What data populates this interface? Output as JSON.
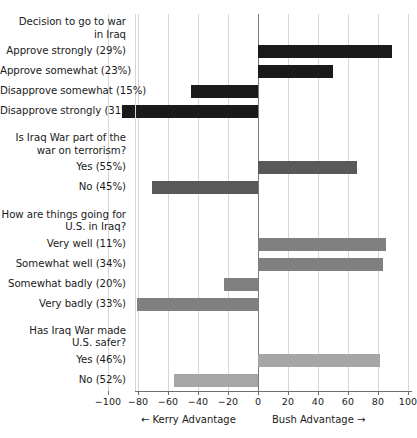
{
  "chart_data": {
    "type": "bar",
    "orientation": "horizontal",
    "title": "",
    "xlabel": "",
    "ylabel": "",
    "xlim": [
      -100,
      100
    ],
    "xticks": [
      -100,
      -80,
      -60,
      -40,
      -20,
      0,
      20,
      40,
      60,
      80,
      100
    ],
    "xtick_labels": [
      "−100",
      "−80",
      "−60",
      "−40",
      "−20",
      "0",
      "20",
      "40",
      "60",
      "80",
      "100"
    ],
    "grid": true,
    "legend": "none",
    "annotations": {
      "left_direction": "←  Kerry Advantage",
      "right_direction": "Bush Advantage  →"
    },
    "colors": {
      "group1": "#1a1a1a",
      "group2": "#595959",
      "group3": "#808080",
      "group4": "#a6a6a6",
      "gridline": "#d6d6d6",
      "zero_line": "#7a7a7a",
      "axis": "#6e6e6e"
    },
    "groups": [
      {
        "heading": "Decision to go to war in Iraq",
        "heading_line1": "Decision to go to war",
        "heading_line2": "in Iraq",
        "color": "#1a1a1a",
        "items": [
          {
            "label": "Approve strongly (29%)",
            "share_pct": 29,
            "value": 89
          },
          {
            "label": "Approve somewhat (23%)",
            "share_pct": 23,
            "value": 50
          },
          {
            "label": "Disapprove somewhat (15%)",
            "share_pct": 15,
            "value": -45
          },
          {
            "label": "Disapprove strongly (31%)",
            "share_pct": 31,
            "value": -91
          }
        ]
      },
      {
        "heading": "Is Iraq War part of the war on terrorism?",
        "heading_line1": "Is Iraq War part of the",
        "heading_line2": "war on terrorism?",
        "color": "#595959",
        "items": [
          {
            "label": "Yes (55%)",
            "share_pct": 55,
            "value": 66
          },
          {
            "label": "No (45%)",
            "share_pct": 45,
            "value": -71
          }
        ]
      },
      {
        "heading": "How are things going for U.S. in Iraq?",
        "heading_line1": "How are things going for",
        "heading_line2": "U.S. in Iraq?",
        "color": "#808080",
        "items": [
          {
            "label": "Very well (11%)",
            "share_pct": 11,
            "value": 85
          },
          {
            "label": "Somewhat well (34%)",
            "share_pct": 34,
            "value": 83
          },
          {
            "label": "Somewhat badly (20%)",
            "share_pct": 20,
            "value": -23
          },
          {
            "label": "Very badly (33%)",
            "share_pct": 33,
            "value": -81
          }
        ]
      },
      {
        "heading": "Has Iraq War made U.S. safer?",
        "heading_line1": "Has Iraq War made",
        "heading_line2": "U.S. safer?",
        "color": "#a6a6a6",
        "items": [
          {
            "label": "Yes (46%)",
            "share_pct": 46,
            "value": 81
          },
          {
            "label": "No (52%)",
            "share_pct": 52,
            "value": -56
          }
        ]
      }
    ]
  }
}
